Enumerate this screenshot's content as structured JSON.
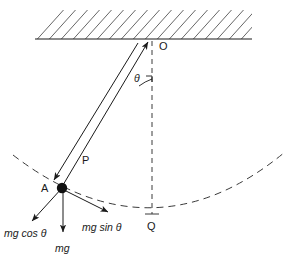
{
  "figure": {
    "background_color": "#ffffff",
    "stroke_color": "#1a1a1a"
  },
  "ceiling": {
    "name": "hatched-ceiling-support",
    "baseline_y": 39,
    "baseline_x_start": 35,
    "baseline_x_end": 252,
    "hatch_count": 19
  },
  "points": [
    {
      "id": "O",
      "label": "O",
      "x": 152,
      "y": 39,
      "label_x": 159,
      "label_y": 41,
      "role": "pivot"
    },
    {
      "id": "A",
      "label": "A",
      "x": 62,
      "y": 188,
      "label_x": 41,
      "label_y": 183,
      "role": "bob-position"
    },
    {
      "id": "Q",
      "label": "Q",
      "x": 152,
      "y": 218,
      "label_x": 147,
      "label_y": 221,
      "role": "lowest-point"
    }
  ],
  "angle": {
    "symbol": "θ",
    "label_x": 134,
    "label_y": 73,
    "between": [
      "string-OA",
      "vertical-OQ"
    ],
    "vertex": "O"
  },
  "string": {
    "name": "pendulum-string",
    "from": "O",
    "to": "A",
    "style": "double-line"
  },
  "forces": [
    {
      "id": "P",
      "label": "P",
      "label_x": 82,
      "label_y": 155,
      "description": "tension along string toward pivot",
      "direction": "up-right along string"
    },
    {
      "id": "mg_cos_theta",
      "label": "mg cos θ",
      "label_x": 4,
      "label_y": 228,
      "description": "weight component along string",
      "direction": "down-left"
    },
    {
      "id": "mg",
      "label": "mg",
      "label_x": 55,
      "label_y": 243,
      "description": "weight of bob",
      "direction": "straight down"
    },
    {
      "id": "mg_sin_theta",
      "label": "mg sin θ",
      "label_x": 82,
      "label_y": 222,
      "description": "weight component tangent to arc",
      "direction": "down-right"
    }
  ],
  "paths": {
    "swing_arc": {
      "name": "pendulum-swing-arc",
      "style": "dashed"
    },
    "vertical_reference": {
      "name": "vertical-reference-line",
      "style": "dashed",
      "from": "O",
      "to": "Q"
    }
  }
}
